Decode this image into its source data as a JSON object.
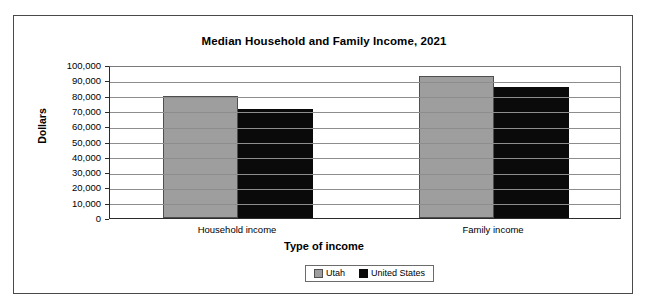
{
  "chart_data": {
    "type": "bar",
    "title": "Median Household and Family Income, 2021",
    "xlabel": "Type of income",
    "ylabel": "Dollars",
    "categories": [
      "Household income",
      "Family income"
    ],
    "series": [
      {
        "name": "Utah",
        "color": "#9e9e9e",
        "values": [
          80000,
          93000
        ]
      },
      {
        "name": "United States",
        "color": "#0a0a0a",
        "values": [
          71000,
          85500
        ]
      }
    ],
    "ylim": [
      0,
      100000
    ],
    "ytick_values": [
      0,
      10000,
      20000,
      30000,
      40000,
      50000,
      60000,
      70000,
      80000,
      90000,
      100000
    ],
    "ytick_labels": [
      "0",
      "10,000",
      "20,000",
      "30,000",
      "40,000",
      "50,000",
      "60,000",
      "70,000",
      "80,000",
      "90,000",
      "100,000"
    ],
    "grid": true,
    "legend_position": "bottom",
    "legend_entries": [
      "Utah",
      "United States"
    ]
  }
}
